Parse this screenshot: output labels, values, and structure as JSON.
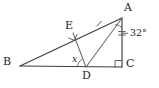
{
  "figure": {
    "background_color": "#ffffff",
    "stroke_color": "#3c3c42",
    "label_color": "#1d1d20",
    "vertices": [
      {
        "id": "A",
        "label": "A",
        "x": 122,
        "y": 18,
        "label_x": 124,
        "label_y": 2
      },
      {
        "id": "B",
        "label": "B",
        "x": 20,
        "y": 66,
        "label_x": 3,
        "label_y": 56
      },
      {
        "id": "C",
        "label": "C",
        "x": 122,
        "y": 67,
        "label_x": 126,
        "label_y": 58
      },
      {
        "id": "D",
        "label": "D",
        "x": 86,
        "y": 67,
        "label_x": 82,
        "label_y": 72
      },
      {
        "id": "E",
        "label": "E",
        "x": 73,
        "y": 33,
        "label_x": 66,
        "label_y": 20
      }
    ],
    "segments": [
      {
        "id": "BA",
        "from": "B",
        "to": "A"
      },
      {
        "id": "BC",
        "from": "B",
        "to": "C"
      },
      {
        "id": "AC",
        "from": "A",
        "to": "C"
      },
      {
        "id": "AD",
        "from": "A",
        "to": "D"
      },
      {
        "id": "ED",
        "from": "E",
        "to": "D"
      }
    ],
    "angles": [
      {
        "id": "angle-x-at-D",
        "vertex": "D",
        "label": "x",
        "label_x": 73,
        "label_y": 56,
        "type": "arc"
      },
      {
        "id": "angle-32-at-A",
        "vertex": "A",
        "label": "32°",
        "label_x": 130,
        "label_y": 30,
        "type": "arc"
      }
    ],
    "right_angles": [
      {
        "id": "right-angle-at-C",
        "vertex": "C",
        "x": 122,
        "y": 67
      },
      {
        "id": "right-angle-at-E",
        "vertex": "E",
        "x": 73,
        "y": 33
      }
    ],
    "tick_marks": [
      {
        "id": "tick-on-EA",
        "segment": "BA",
        "x": 99,
        "y": 23
      },
      {
        "id": "tick-on-AC",
        "segment": "AC",
        "x": 122,
        "y": 33
      }
    ]
  }
}
